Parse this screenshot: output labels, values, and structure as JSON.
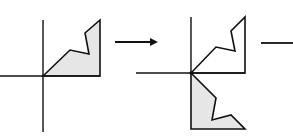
{
  "diagram": {
    "colors": {
      "stroke": "#111111",
      "fill": "#e6e6e6",
      "background": "#ffffff"
    },
    "panels": [
      {
        "id": "original",
        "axes": {
          "vertical": [
            43,
            20,
            43,
            132
          ],
          "horizontal": [
            0,
            76,
            100,
            76
          ]
        },
        "polygons": [
          {
            "role": "original-shape",
            "filled": true,
            "points": "43,76 70,50 89,54 85,33 100,20 100,76"
          }
        ]
      },
      {
        "id": "reflected",
        "axes": {
          "vertical": [
            191,
            17,
            191,
            73
          ],
          "horizontal": [
            136,
            73,
            245,
            73
          ]
        },
        "polygons": [
          {
            "role": "original-outline",
            "filled": false,
            "points": "191,73 216,47 235,51 231,31 245,17 245,73"
          },
          {
            "role": "reflected-shape",
            "filled": true,
            "points": "191,73 216,98 212,120 231,115 245,129 191,129"
          }
        ]
      }
    ],
    "arrows": [
      {
        "id": "arrow-1",
        "from": [
          115,
          42
        ],
        "to": [
          157,
          42
        ],
        "has_head": true
      },
      {
        "id": "arrow-2",
        "from": [
          261,
          43
        ],
        "to": [
          293,
          43
        ],
        "has_head": false
      }
    ]
  }
}
